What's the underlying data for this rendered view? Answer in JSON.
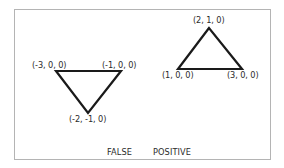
{
  "diagram": {
    "triangles": [
      {
        "name": "left-triangle",
        "orientation": "inverted",
        "vertices": [
          {
            "label": "(-3, 0, 0)",
            "coord": [
              -3,
              0,
              0
            ]
          },
          {
            "label": "(-1, 0, 0)",
            "coord": [
              -1,
              0,
              0
            ]
          },
          {
            "label": "(-2, -1, 0)",
            "coord": [
              -2,
              -1,
              0
            ]
          }
        ]
      },
      {
        "name": "right-triangle",
        "orientation": "upright",
        "vertices": [
          {
            "label": "(2, 1, 0)",
            "coord": [
              2,
              1,
              0
            ]
          },
          {
            "label": "(1, 0, 0)",
            "coord": [
              1,
              0,
              0
            ]
          },
          {
            "label": "(3, 0, 0)",
            "coord": [
              3,
              0,
              0
            ]
          }
        ]
      }
    ],
    "caption": {
      "left": "FALSE",
      "right": "POSITIVE"
    },
    "colors": {
      "stroke": "#1a1a1a",
      "frame": "#b4b4b4",
      "text": "#2b2b2b"
    }
  }
}
